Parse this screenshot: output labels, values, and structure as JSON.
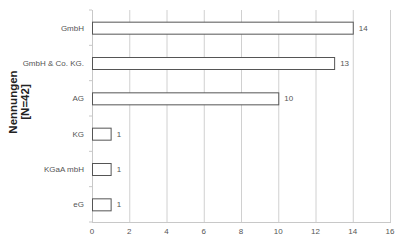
{
  "chart_data": {
    "type": "bar",
    "orientation": "horizontal",
    "title": "",
    "xlabel": "",
    "ylabel": "Nennungen [N=42]",
    "ylabel_lines": [
      "Nennungen",
      "[N=42]"
    ],
    "categories": [
      "GmbH",
      "GmbH & Co. KG.",
      "AG",
      "KG",
      "KGaA mbH",
      "eG"
    ],
    "values": [
      14,
      13,
      10,
      1,
      1,
      1
    ],
    "data_labels": [
      "14",
      "13",
      "10",
      "1",
      "1",
      "1"
    ],
    "xlim": [
      0,
      16
    ],
    "xticks": [
      0,
      2,
      4,
      6,
      8,
      10,
      12,
      14,
      16
    ],
    "grid": {
      "vertical": true,
      "horizontal": false
    },
    "legend": null,
    "colors": {
      "bar_fill": "#ffffff",
      "bar_stroke": "#555555",
      "grid": "#d0d0d0",
      "text": "#555555"
    }
  }
}
